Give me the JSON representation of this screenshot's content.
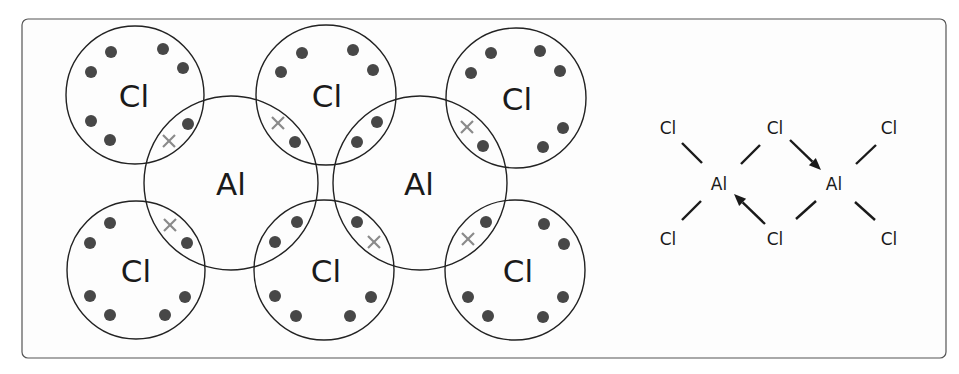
{
  "colors": {
    "frame_stroke": "#555555",
    "shell_stroke": "#222222",
    "dot": "#474747",
    "cross": "#8a8a8a",
    "text": "#1a1a1a"
  },
  "frame": {
    "x": 22,
    "y": 19,
    "width": 924,
    "height": 339,
    "radius": 6
  },
  "dot_and_cross": {
    "atoms": [
      {
        "id": "cl-top-left",
        "label": "Cl",
        "cx": 135,
        "cy": 95,
        "r": 69
      },
      {
        "id": "cl-top-middle",
        "label": "Cl",
        "cx": 326,
        "cy": 95,
        "r": 70
      },
      {
        "id": "cl-top-right",
        "label": "Cl",
        "cx": 516,
        "cy": 98,
        "r": 70
      },
      {
        "id": "al-left",
        "label": "Al",
        "cx": 231,
        "cy": 183,
        "r": 87
      },
      {
        "id": "al-right",
        "label": "Al",
        "cx": 420,
        "cy": 183,
        "r": 87
      },
      {
        "id": "cl-bottom-left",
        "label": "Cl",
        "cx": 136,
        "cy": 270,
        "r": 69
      },
      {
        "id": "cl-bottom-middle",
        "label": "Cl",
        "cx": 324,
        "cy": 270,
        "r": 70
      },
      {
        "id": "cl-bottom-right",
        "label": "Cl",
        "cx": 515,
        "cy": 270,
        "r": 70
      }
    ],
    "labels": [
      {
        "text": "Cl",
        "x": 134,
        "y": 96
      },
      {
        "text": "Cl",
        "x": 327,
        "y": 96
      },
      {
        "text": "Cl",
        "x": 517,
        "y": 99
      },
      {
        "text": "Al",
        "x": 231,
        "y": 184
      },
      {
        "text": "Al",
        "x": 419,
        "y": 184
      },
      {
        "text": "Cl",
        "x": 136,
        "y": 271
      },
      {
        "text": "Cl",
        "x": 326,
        "y": 271
      },
      {
        "text": "Cl",
        "x": 518,
        "y": 271
      }
    ],
    "electrons_dots": [
      [
        111,
        52
      ],
      [
        163,
        49
      ],
      [
        91,
        72
      ],
      [
        183,
        68
      ],
      [
        91,
        121
      ],
      [
        110,
        140
      ],
      [
        188,
        124
      ],
      [
        302,
        53
      ],
      [
        353,
        50
      ],
      [
        281,
        72
      ],
      [
        373,
        70
      ],
      [
        295,
        142
      ],
      [
        357,
        142
      ],
      [
        377,
        122
      ],
      [
        491,
        53
      ],
      [
        540,
        51
      ],
      [
        471,
        73
      ],
      [
        560,
        71
      ],
      [
        563,
        128
      ],
      [
        543,
        147
      ],
      [
        483,
        146
      ],
      [
        110,
        223
      ],
      [
        90,
        243
      ],
      [
        90,
        296
      ],
      [
        110,
        315
      ],
      [
        165,
        315
      ],
      [
        185,
        297
      ],
      [
        187,
        243
      ],
      [
        297,
        222
      ],
      [
        275,
        242
      ],
      [
        357,
        222
      ],
      [
        275,
        296
      ],
      [
        296,
        316
      ],
      [
        350,
        316
      ],
      [
        371,
        297
      ],
      [
        486,
        222
      ],
      [
        544,
        224
      ],
      [
        564,
        244
      ],
      [
        468,
        297
      ],
      [
        488,
        316
      ],
      [
        543,
        317
      ],
      [
        563,
        297
      ]
    ],
    "electrons_crosses": [
      [
        169,
        141
      ],
      [
        278,
        123
      ],
      [
        467,
        127
      ],
      [
        170,
        225
      ],
      [
        374,
        242
      ],
      [
        468,
        239
      ]
    ],
    "dot_radius": 6,
    "cross_half_size": 6
  },
  "structural_formula": {
    "labels": [
      {
        "text": "Cl",
        "x": 668,
        "y": 128
      },
      {
        "text": "Cl",
        "x": 775,
        "y": 128
      },
      {
        "text": "Cl",
        "x": 889,
        "y": 128
      },
      {
        "text": "Al",
        "x": 719,
        "y": 184
      },
      {
        "text": "Al",
        "x": 834,
        "y": 184
      },
      {
        "text": "Cl",
        "x": 668,
        "y": 239
      },
      {
        "text": "Cl",
        "x": 775,
        "y": 239
      },
      {
        "text": "Cl",
        "x": 889,
        "y": 239
      }
    ],
    "bonds": [
      [
        682,
        143,
        702,
        163
      ],
      [
        760,
        145,
        741,
        164
      ],
      [
        876,
        145,
        856,
        164
      ],
      [
        682,
        220,
        701,
        201
      ],
      [
        796,
        219,
        816,
        201
      ],
      [
        855,
        202,
        875,
        220
      ]
    ],
    "dative_bonds": [
      {
        "from": [
          790,
          140
        ],
        "to": [
          821,
          170
        ]
      },
      {
        "from": [
          765,
          224
        ],
        "to": [
          734,
          194
        ]
      }
    ]
  }
}
